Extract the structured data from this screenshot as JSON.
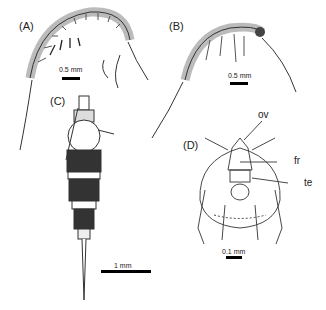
{
  "figure": {
    "panels": [
      {
        "id": "A",
        "label": "(A)",
        "scale_bar": "0.5 mm",
        "view": "lateral habitus"
      },
      {
        "id": "B",
        "label": "(B)",
        "scale_bar": "0.5 mm",
        "view": "lateral habitus"
      },
      {
        "id": "C",
        "label": "(C)",
        "scale_bar": "1 mm",
        "view": "dorsal habitus"
      },
      {
        "id": "D",
        "label": "(D)",
        "scale_bar": "0.1 mm",
        "view": "head, ventral/frontal",
        "annotations": [
          "ov",
          "fr",
          "te"
        ]
      }
    ]
  }
}
